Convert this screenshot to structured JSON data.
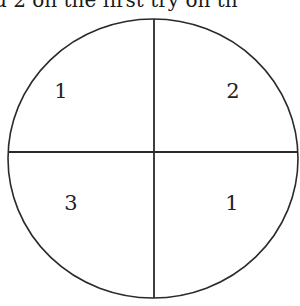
{
  "caption": {
    "text": "d 2 on the first try on th"
  },
  "spinner": {
    "stroke_color": "#2a2a2a",
    "sections": [
      {
        "position": "top-left",
        "label": "1"
      },
      {
        "position": "top-right",
        "label": "2"
      },
      {
        "position": "bottom-left",
        "label": "3"
      },
      {
        "position": "bottom-right",
        "label": "1"
      }
    ]
  }
}
